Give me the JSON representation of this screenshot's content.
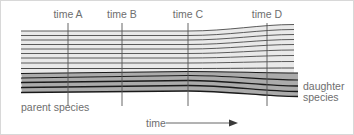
{
  "figure": {
    "background_color": "#ffffff",
    "border_color": "#d8d8d8",
    "text_color": "#6e6e6e",
    "line_color_parent": "#4a4a4a",
    "line_color_daughter": "#1a1a1a",
    "tick_color": "#555555"
  },
  "time_markers": [
    {
      "label": "time A",
      "x": 67,
      "label_x": 67,
      "label_y": 17,
      "y_top": 22,
      "y_bottom": 105
    },
    {
      "label": "time B",
      "x": 121,
      "label_x": 121,
      "label_y": 17,
      "y_top": 22,
      "y_bottom": 105
    },
    {
      "label": "time C",
      "x": 187,
      "label_x": 187,
      "label_y": 17,
      "y_top": 22,
      "y_bottom": 105
    },
    {
      "label": "time D",
      "x": 266,
      "label_x": 266,
      "label_y": 17,
      "y_top": 22,
      "y_bottom": 105
    }
  ],
  "labels": {
    "parent_species": "parent species",
    "daughter_species_line1": "daughter",
    "daughter_species_line2": "species",
    "time_axis": "time"
  },
  "chart_data": {
    "type": "line",
    "xlabel": "time",
    "ylabel": "",
    "grid": false,
    "legend": "none",
    "split_event": {
      "at": "time C",
      "x": 187,
      "y": 68
    },
    "x_start": 20,
    "x_split": 187,
    "x_end": 293,
    "x_end_daughter": 297,
    "series": [
      {
        "name": "parent-lineage-1",
        "group": "parent",
        "y_start": 30.0,
        "y_split": 30.0,
        "y_end": 23.5,
        "weight": 0.9
      },
      {
        "name": "parent-lineage-2",
        "group": "parent",
        "y_start": 34.5,
        "y_split": 34.5,
        "y_end": 28.5,
        "weight": 0.9
      },
      {
        "name": "parent-lineage-3",
        "group": "parent",
        "y_start": 39.0,
        "y_split": 39.0,
        "y_end": 33.5,
        "weight": 0.9
      },
      {
        "name": "parent-lineage-4",
        "group": "parent",
        "y_start": 43.5,
        "y_split": 43.5,
        "y_end": 38.5,
        "weight": 0.9
      },
      {
        "name": "parent-lineage-5",
        "group": "parent",
        "y_start": 48.0,
        "y_split": 48.0,
        "y_end": 43.5,
        "weight": 0.9
      },
      {
        "name": "parent-lineage-6",
        "group": "parent",
        "y_start": 52.5,
        "y_split": 52.5,
        "y_end": 49.0,
        "weight": 0.9
      },
      {
        "name": "parent-lineage-7",
        "group": "parent",
        "y_start": 57.0,
        "y_split": 57.0,
        "y_end": 54.5,
        "weight": 0.9
      },
      {
        "name": "parent-lineage-8",
        "group": "parent",
        "y_start": 62.0,
        "y_split": 62.0,
        "y_end": 60.5,
        "weight": 0.9
      },
      {
        "name": "parent-lineage-9",
        "group": "parent",
        "y_start": 67.5,
        "y_split": 67.5,
        "y_end": 67.0,
        "weight": 1.0
      },
      {
        "name": "daughter-lineage-1",
        "group": "daughter",
        "y_start": 72.5,
        "y_split": 70.5,
        "y_end": 72.0,
        "weight": 1.1
      },
      {
        "name": "daughter-lineage-2",
        "group": "daughter",
        "y_start": 77.0,
        "y_split": 74.5,
        "y_end": 79.0,
        "weight": 1.2
      },
      {
        "name": "daughter-lineage-3",
        "group": "daughter",
        "y_start": 81.5,
        "y_split": 79.5,
        "y_end": 85.0,
        "weight": 1.3
      },
      {
        "name": "daughter-lineage-4",
        "group": "daughter",
        "y_start": 86.5,
        "y_split": 84.5,
        "y_end": 90.5,
        "weight": 1.3
      },
      {
        "name": "daughter-lineage-5",
        "group": "daughter",
        "y_start": 91.5,
        "y_split": 90.0,
        "y_end": 95.5,
        "weight": 1.3
      }
    ]
  },
  "time_axis_arrow": {
    "label_x": 145,
    "line_x1": 165,
    "line_x2": 228,
    "y": 122
  }
}
